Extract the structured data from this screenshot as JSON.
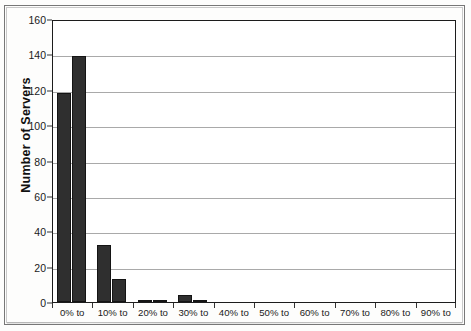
{
  "chart_data": {
    "type": "bar",
    "title": "",
    "subtitle": "",
    "xlabel": "",
    "ylabel": "Number of Servers",
    "categories": [
      "0% to",
      "10% to",
      "20% to",
      "30% to",
      "40% to",
      "50% to",
      "60% to",
      "70% to",
      "80% to",
      "90% to"
    ],
    "series": [
      {
        "name": "series-1",
        "values": [
          118,
          32,
          1,
          4,
          0,
          0,
          0,
          0,
          0,
          0
        ]
      },
      {
        "name": "series-2",
        "values": [
          139,
          13,
          1,
          1,
          0,
          0,
          0,
          0,
          0,
          0
        ]
      }
    ],
    "ylim": [
      0,
      160
    ],
    "ytick_values": [
      0,
      20,
      40,
      60,
      80,
      100,
      120,
      140,
      160
    ],
    "ytick_labels": [
      "0",
      "20",
      "40",
      "60",
      "80",
      "100",
      "120",
      "140",
      "160"
    ],
    "grid": true,
    "grid_axis": "y",
    "legend": false,
    "legend_position": "none",
    "bar_color": "#2f2f2f",
    "grid_color": "#a9a9a9",
    "frame_color": "#1c1c1c",
    "annotations": []
  }
}
